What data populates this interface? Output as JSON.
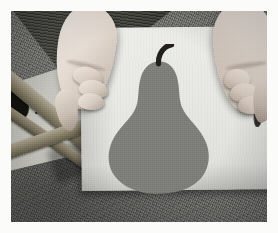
{
  "photo": {
    "subject": "hands holding a sheet of paper with a pear silhouette",
    "orientation": "landscape",
    "color_mode": "grayscale",
    "border_label": "white photo border",
    "border_color": "#fbfbfa",
    "border_width_px": 11,
    "canvas": {
      "width_px": 256,
      "height_px": 211
    }
  },
  "scene": {
    "background": {
      "name": "carpet-floor",
      "description": "dark gray textured carpet",
      "color": "#72726f"
    },
    "furniture": {
      "name": "wooden-chair-frame",
      "description": "light wooden rails of a chair or stool crossing the upper-left corner",
      "wood_color": "#8e866f",
      "shadow_color": "#3a3a38",
      "panel_color": "#c0c0b8",
      "hole_label": "dark opening between rails"
    },
    "paper": {
      "name": "paper-sheet",
      "description": "large square off-white sheet of paper held upright",
      "color": "#e9e9e5",
      "shadow": "cast shadow toward lower-left"
    },
    "pear": {
      "name": "pear-silhouette",
      "description": "solid medium-gray pear shape printed on the paper",
      "body_color": "#7e7e7b",
      "stem_color": "#231f1e",
      "stem_label": "curved stem leaning right"
    },
    "hands": [
      {
        "name": "hand-left",
        "side": "left",
        "description": "left hand gripping the left edge of the paper, fingers curled over the front",
        "skin_color": "#e5dbd2",
        "visible_fingers": 3
      },
      {
        "name": "hand-right",
        "side": "right",
        "description": "right hand gripping the right edge of the paper, thumb hidden behind",
        "skin_color": "#e3d9d0",
        "visible_fingers": 3
      }
    ]
  }
}
